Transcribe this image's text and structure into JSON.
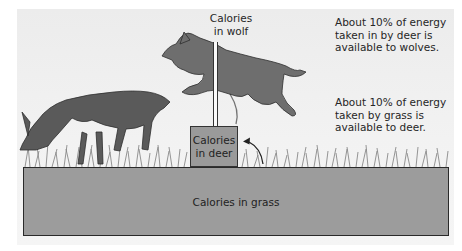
{
  "diagram": {
    "type": "energy-pyramid",
    "levels": [
      {
        "name": "grass",
        "label": "Calories in grass"
      },
      {
        "name": "deer",
        "label_line1": "Calories",
        "label_line2": "in deer"
      },
      {
        "name": "wolf",
        "label_line1": "Calories",
        "label_line2": "in wolf"
      }
    ],
    "notes": {
      "deer_to_wolf": [
        "About 10% of energy",
        "taken in by deer is",
        "available to wolves."
      ],
      "grass_to_deer": [
        "About 10% of energy",
        "taken by grass is",
        "available to deer."
      ]
    },
    "colors": {
      "background": "#efefef",
      "box_fill": "#9c9c9c",
      "box_border": "#2a2a2a",
      "text": "#262626"
    }
  }
}
